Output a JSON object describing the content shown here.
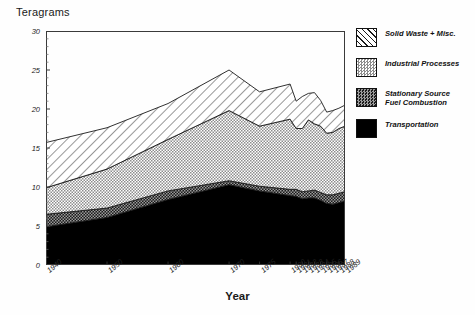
{
  "chart_data": {
    "type": "area",
    "stacked": true,
    "title": "",
    "xlabel": "Year",
    "ylabel": "Teragrams",
    "ylim": [
      0,
      30
    ],
    "yticks": [
      0,
      5,
      10,
      15,
      20,
      25,
      30
    ],
    "grid": false,
    "legend_position": "right",
    "categories": [
      "1940",
      "1950",
      "1960",
      "1970",
      "1975",
      "1980",
      "1981",
      "1982",
      "1983",
      "1984",
      "1985",
      "1986",
      "1987",
      "1988",
      "1989"
    ],
    "series": [
      {
        "name": "Transportation",
        "pattern": "solid-black",
        "color": "#000000",
        "values": [
          4.9,
          6.1,
          8.4,
          10.3,
          9.5,
          8.9,
          8.8,
          8.5,
          8.6,
          8.6,
          8.3,
          7.9,
          7.8,
          8.0,
          8.2
        ]
      },
      {
        "name": "Stationary Source Fuel Combustion",
        "pattern": "dark-checker",
        "color": "#555555",
        "values": [
          1.6,
          1.2,
          1.1,
          0.5,
          0.6,
          0.8,
          0.9,
          0.9,
          0.9,
          1.0,
          1.0,
          1.1,
          1.2,
          1.2,
          1.2
        ]
      },
      {
        "name": "Industrial Processes",
        "pattern": "light-dots",
        "color": "#b9b9b9",
        "values": [
          3.4,
          5.0,
          6.6,
          9.0,
          7.7,
          9.0,
          7.8,
          8.1,
          9.1,
          8.5,
          8.5,
          7.9,
          8.0,
          8.3,
          8.4
        ]
      },
      {
        "name": "Solid Waste + Misc.",
        "pattern": "diagonal-hatch",
        "color": "#ffffff",
        "values": [
          5.8,
          5.3,
          4.6,
          5.2,
          4.4,
          4.5,
          3.5,
          4.1,
          3.4,
          4.0,
          3.3,
          2.7,
          2.8,
          2.6,
          2.7
        ]
      }
    ],
    "stack_totals": [
      15.7,
      17.6,
      20.7,
      25.0,
      22.2,
      23.2,
      21.0,
      21.6,
      22.0,
      22.1,
      21.1,
      19.6,
      19.8,
      20.1,
      20.5
    ]
  },
  "legend": {
    "items": [
      {
        "label": "Solid Waste + Misc.",
        "pattern": "diagonal-hatch"
      },
      {
        "label": "Industrial Processes",
        "pattern": "light-dots"
      },
      {
        "label": "Stationary Source\nFuel Combustion",
        "pattern": "dark-checker"
      },
      {
        "label": "Transportation",
        "pattern": "solid-black"
      }
    ]
  }
}
